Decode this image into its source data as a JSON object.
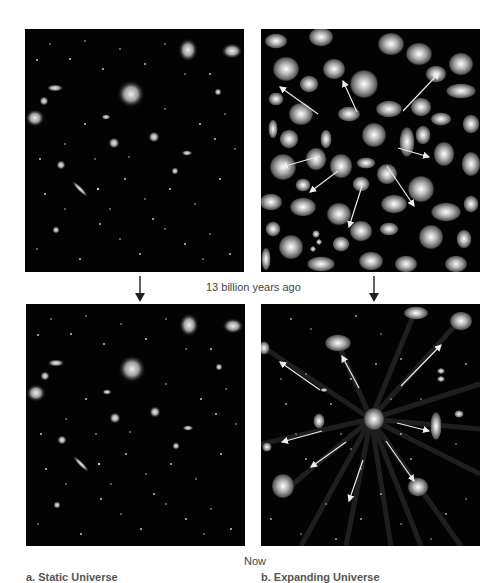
{
  "figure": {
    "time_labels": {
      "then": "13 billion years ago",
      "now": "Now"
    },
    "captions": {
      "left": "a. Static Universe",
      "right": "b. Expanding Universe"
    },
    "panels": [
      {
        "id": "top-left",
        "scenario": "static",
        "time": "13 billion years ago",
        "content": "sparse field of small galaxies on black background"
      },
      {
        "id": "top-right",
        "scenario": "expanding",
        "time": "13 billion years ago",
        "content": "densely packed spiral and elliptical galaxies with white arrows pointing outward"
      },
      {
        "id": "bottom-left",
        "scenario": "static",
        "time": "Now",
        "content": "same sparse field of galaxies, unchanged"
      },
      {
        "id": "bottom-right",
        "scenario": "expanding",
        "time": "Now",
        "content": "galaxies spread apart with motion streaks and white arrows radiating from center"
      }
    ],
    "colors": {
      "background": "#ffffff",
      "panel": "#030303",
      "arrow": "#e8e8e8",
      "text": "#444444"
    }
  }
}
